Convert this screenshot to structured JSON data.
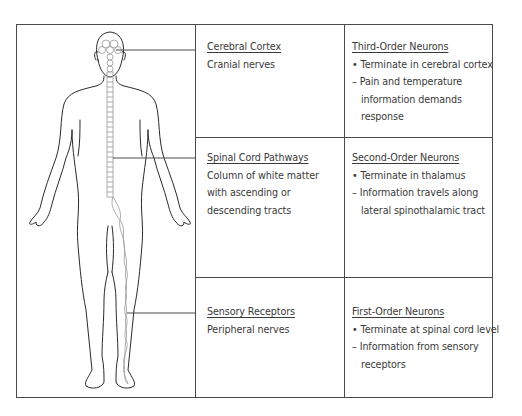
{
  "diagram": {
    "type": "sensory-pathway-body-diagram",
    "figure_label": "human-body-outline-with-nervous-system"
  },
  "rows": [
    {
      "structure": {
        "title": "Cerebral Cortex",
        "lines": [
          "Cranial nerves"
        ]
      },
      "neurons": {
        "title": "Third-Order Neurons",
        "lines": [
          {
            "marker": "•",
            "text": "Terminate in cerebral cortex"
          },
          {
            "marker": "–",
            "text": "Pain and temperature"
          },
          {
            "marker": "",
            "text": "information demands"
          },
          {
            "marker": "",
            "text": "response"
          }
        ]
      }
    },
    {
      "structure": {
        "title": "Spinal Cord Pathways",
        "lines": [
          "Column of white matter",
          "with ascending or",
          "descending tracts"
        ]
      },
      "neurons": {
        "title": "Second-Order Neurons",
        "lines": [
          {
            "marker": "•",
            "text": "Terminate in  thalamus"
          },
          {
            "marker": "–",
            "text": "Information travels along"
          },
          {
            "marker": "",
            "text": "lateral spinothalamic tract"
          }
        ]
      }
    },
    {
      "structure": {
        "title": "Sensory Receptors",
        "lines": [
          "Peripheral nerves"
        ]
      },
      "neurons": {
        "title": "First-Order Neurons",
        "lines": [
          {
            "marker": "•",
            "text": "Terminate at spinal cord level"
          },
          {
            "marker": "–",
            "text": "Information from sensory"
          },
          {
            "marker": "",
            "text": "receptors"
          }
        ]
      }
    }
  ],
  "colors": {
    "border": "#4a4a4a",
    "text": "#3a3a3a",
    "figure_outline": "#2a2a2a",
    "nerve_outline": "#9a9a9a"
  }
}
